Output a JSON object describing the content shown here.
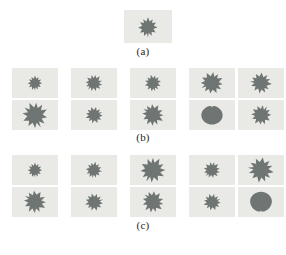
{
  "figure": {
    "background_color": "#ffffff",
    "tile_background_color": "#e9e9e6",
    "leaf_color": "#6f7573",
    "caption_color": "#262626"
  },
  "panels": [
    {
      "id": "a",
      "caption": "(a)",
      "rows": 1,
      "columns": 1,
      "tiles": [
        {
          "row": 1,
          "column": 1,
          "shape": "maple-leaf-original",
          "rotation": 0,
          "scale": 1.0
        }
      ]
    },
    {
      "id": "b",
      "caption": "(b)",
      "rows": 2,
      "columns": 5,
      "tiles": [
        {
          "row": 1,
          "column": 1,
          "shape": "maple-leaf-small",
          "rotation": 0,
          "scale": 0.62
        },
        {
          "row": 1,
          "column": 2,
          "shape": "maple-leaf-rotated",
          "rotation": 40,
          "scale": 0.72
        },
        {
          "row": 1,
          "column": 3,
          "shape": "maple-leaf-small",
          "rotation": -15,
          "scale": 0.7
        },
        {
          "row": 1,
          "column": 4,
          "shape": "maple-leaf-rotated",
          "rotation": 65,
          "scale": 0.95
        },
        {
          "row": 1,
          "column": 5,
          "shape": "maple-leaf-rotated",
          "rotation": 95,
          "scale": 0.88
        },
        {
          "row": 2,
          "column": 1,
          "shape": "maple-leaf-large",
          "rotation": -25,
          "scale": 1.05
        },
        {
          "row": 2,
          "column": 2,
          "shape": "maple-leaf-rotated",
          "rotation": 250,
          "scale": 0.72
        },
        {
          "row": 2,
          "column": 3,
          "shape": "maple-leaf-rotated",
          "rotation": 120,
          "scale": 0.92
        },
        {
          "row": 2,
          "column": 4,
          "shape": "leaf-blob",
          "rotation": 180,
          "scale": 1.0
        },
        {
          "row": 2,
          "column": 5,
          "shape": "maple-leaf-rotated",
          "rotation": 215,
          "scale": 0.85
        }
      ]
    },
    {
      "id": "c",
      "caption": "(c)",
      "rows": 2,
      "columns": 5,
      "tiles": [
        {
          "row": 1,
          "column": 1,
          "shape": "maple-leaf-small",
          "rotation": 0,
          "scale": 0.62
        },
        {
          "row": 1,
          "column": 2,
          "shape": "maple-leaf-small",
          "rotation": 10,
          "scale": 0.68
        },
        {
          "row": 1,
          "column": 3,
          "shape": "maple-leaf-large",
          "rotation": 30,
          "scale": 1.0
        },
        {
          "row": 1,
          "column": 4,
          "shape": "maple-leaf-rotated",
          "rotation": 45,
          "scale": 0.7
        },
        {
          "row": 1,
          "column": 5,
          "shape": "maple-leaf-large",
          "rotation": 100,
          "scale": 1.0
        },
        {
          "row": 2,
          "column": 1,
          "shape": "maple-leaf-rotated",
          "rotation": 120,
          "scale": 0.95
        },
        {
          "row": 2,
          "column": 2,
          "shape": "maple-leaf-rotated",
          "rotation": 255,
          "scale": 0.75
        },
        {
          "row": 2,
          "column": 3,
          "shape": "maple-leaf-rotated",
          "rotation": 130,
          "scale": 0.92
        },
        {
          "row": 2,
          "column": 4,
          "shape": "maple-leaf-rotated",
          "rotation": 250,
          "scale": 0.72
        },
        {
          "row": 2,
          "column": 5,
          "shape": "leaf-blob",
          "rotation": 0,
          "scale": 1.0
        }
      ]
    }
  ]
}
